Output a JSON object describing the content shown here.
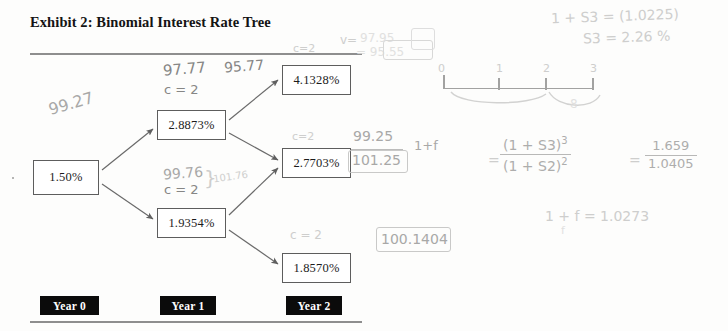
{
  "exhibit": {
    "title": "Exhibit 2: Binomial Interest Rate Tree",
    "nodes": {
      "year0": "1.50%",
      "year1_up": "2.8873%",
      "year1_down": "1.9354%",
      "year2_up": "4.1328%",
      "year2_mid": "2.7703%",
      "year2_down": "1.8570%"
    },
    "year_labels": {
      "year0": "Year 0",
      "year1": "Year 1",
      "year2": "Year 2"
    },
    "colors": {
      "node_border": "#5d5d5d",
      "chip_background": "#0b0b0b",
      "chip_text": "#ffffff",
      "rule": "#8e8e8e",
      "arrow": "#6a6a6a",
      "handwriting": "#9a9a99"
    }
  },
  "handwriting": {
    "left_value": "99.27",
    "up_value_1": "97.77",
    "up_value_2": "95.77",
    "up_coupon": "c = 2",
    "top_coupon": "c=2",
    "top_v_label": "v=",
    "top_v_value": "97.95",
    "top_v_result": "= 95.55",
    "mid_coupon": "c=2",
    "mid_value": "99.25",
    "mid_denominator": "101.25",
    "mid_one_plus_f": "1+f",
    "down_value": "99.76",
    "down_value_right": "101.76",
    "down_coupon": "c = 2",
    "low_coupon": "c = 2",
    "low_value": "100.1404",
    "spot_line_1": "1 + S3 = (1.0225)",
    "spot_line_2": "S3 = 2.26 %",
    "timeline_ticks": [
      "0",
      "1",
      "2",
      "3"
    ],
    "brace_label": "8",
    "formula_numerator": "(1 + S3)",
    "formula_numerator_exp": "3",
    "formula_denominator": "(1 + S2)",
    "formula_denominator_exp": "2",
    "formula_equals": "=",
    "formula_result_num": "1.659",
    "formula_result_den": "1.0405",
    "result_line": "1 + f = 1.0273",
    "result_sub": "f"
  }
}
